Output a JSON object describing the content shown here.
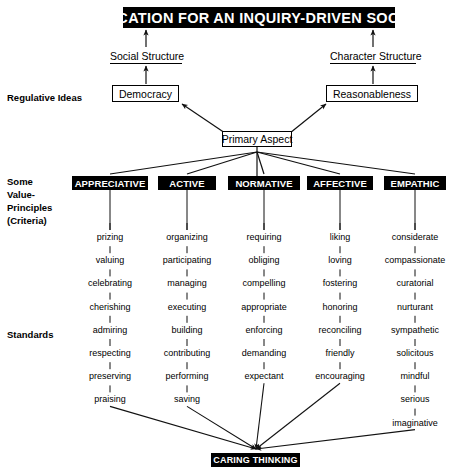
{
  "title_banner": "EDUCATION FOR AN INQUIRY-DRIVEN SOCIETY",
  "bottom_banner": "CARING THINKING",
  "structures": {
    "social": "Social Structure",
    "character": "Character Structure"
  },
  "regulative_ideas": {
    "left": "Democracy",
    "right": "Reasonableness"
  },
  "primary_aspect": "Primary Aspect",
  "tier_labels": {
    "regulative": "Regulative Ideas",
    "criteria_line1": "Some",
    "criteria_line2": "Value-",
    "criteria_line3": "Principles",
    "criteria_line4": "(Criteria)",
    "standards": "Standards"
  },
  "colors": {
    "banner_bg": "#000000",
    "banner_text": "#ffffff",
    "line": "#1a1a1a",
    "page_bg": "#ffffff"
  },
  "columns": [
    {
      "header": "APPRECIATIVE",
      "center_x": 110,
      "words": [
        "prizing",
        "valuing",
        "celebrating",
        "cherishing",
        "admiring",
        "respecting",
        "preserving",
        "praising"
      ]
    },
    {
      "header": "ACTIVE",
      "center_x": 187,
      "words": [
        "organizing",
        "participating",
        "managing",
        "executing",
        "building",
        "contributing",
        "performing",
        "saving"
      ]
    },
    {
      "header": "NORMATIVE",
      "center_x": 264,
      "words": [
        "requiring",
        "obliging",
        "compelling",
        "appropriate",
        "enforcing",
        "demanding",
        "expectant"
      ]
    },
    {
      "header": "AFFECTIVE",
      "center_x": 340,
      "words": [
        "liking",
        "loving",
        "fostering",
        "honoring",
        "reconciling",
        "friendly",
        "encouraging"
      ]
    },
    {
      "header": "EMPATHIC",
      "center_x": 415,
      "words": [
        "considerate",
        "compassionate",
        "curatorial",
        "nurturant",
        "sympathetic",
        "solicitous",
        "mindful",
        "serious",
        "imaginative"
      ]
    }
  ]
}
